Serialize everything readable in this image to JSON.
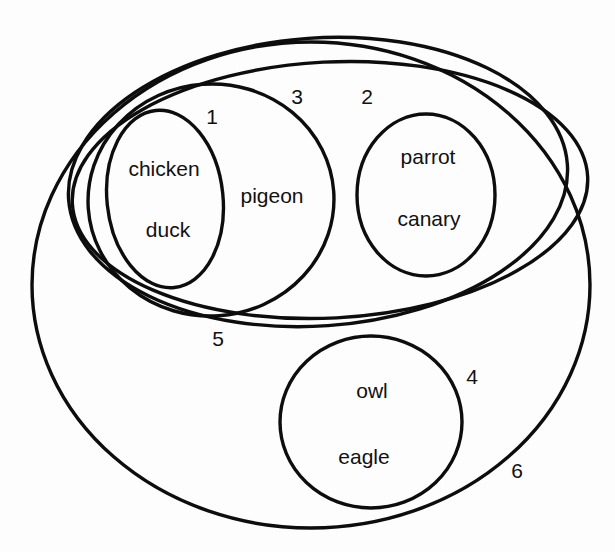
{
  "diagram": {
    "type": "nested-set-venn",
    "title": "",
    "background_color": "#fdfdfd",
    "stroke_color": "#0d0d0d",
    "text_color": "#111111",
    "regions": [
      {
        "id": "region-1",
        "label": "1",
        "label_x": 212,
        "label_y": 118,
        "shape": "ellipse",
        "cx": 165,
        "cy": 199,
        "rx": 58,
        "ry": 89,
        "rotation": -6,
        "members": [
          "chicken",
          "duck"
        ],
        "contains": []
      },
      {
        "id": "region-3",
        "label": "3",
        "label_x": 297,
        "label_y": 98,
        "shape": "ellipse",
        "cx": 211,
        "cy": 200,
        "rx": 123,
        "ry": 116,
        "rotation": -4,
        "members": [
          "pigeon"
        ],
        "contains": [
          "region-1"
        ]
      },
      {
        "id": "region-2",
        "label": "2",
        "label_x": 367,
        "label_y": 98,
        "shape": "ellipse",
        "cx": 330,
        "cy": 190,
        "rx": 258,
        "ry": 128,
        "rotation": -3,
        "members": [],
        "contains": [
          "region-3",
          "region-parrot"
        ]
      },
      {
        "id": "region-parrot",
        "label": "",
        "shape": "ellipse",
        "cx": 426,
        "cy": 195,
        "rx": 69,
        "ry": 81,
        "rotation": 0,
        "members": [
          "parrot",
          "canary"
        ],
        "contains": []
      },
      {
        "id": "region-5",
        "label": "5",
        "label_x": 218,
        "label_y": 340,
        "shape": "ellipse",
        "cx": 318,
        "cy": 182,
        "rx": 250,
        "ry": 144,
        "rotation": -4,
        "members": [],
        "contains": [
          "region-3"
        ]
      },
      {
        "id": "region-4",
        "label": "4",
        "label_x": 472,
        "label_y": 378,
        "shape": "ellipse",
        "cx": 371,
        "cy": 422,
        "rx": 91,
        "ry": 86,
        "rotation": 0,
        "members": [
          "owl",
          "eagle"
        ],
        "contains": []
      },
      {
        "id": "region-6",
        "label": "6",
        "label_x": 517,
        "label_y": 472,
        "shape": "ellipse",
        "cx": 311,
        "cy": 285,
        "rx": 279,
        "ry": 243,
        "rotation": 0,
        "members": [],
        "contains": [
          "region-2",
          "region-5",
          "region-4"
        ]
      }
    ],
    "members": [
      {
        "name": "chicken",
        "x": 164,
        "y": 170,
        "region": "region-1"
      },
      {
        "name": "duck",
        "x": 168,
        "y": 231,
        "region": "region-1"
      },
      {
        "name": "pigeon",
        "x": 272,
        "y": 197,
        "region": "region-3"
      },
      {
        "name": "parrot",
        "x": 428,
        "y": 158,
        "region": "region-parrot"
      },
      {
        "name": "canary",
        "x": 429,
        "y": 220,
        "region": "region-parrot"
      },
      {
        "name": "owl",
        "x": 372,
        "y": 392,
        "region": "region-4"
      },
      {
        "name": "eagle",
        "x": 364,
        "y": 458,
        "region": "region-4"
      }
    ],
    "set_labels": [
      {
        "text": "1",
        "x": 212,
        "y": 118
      },
      {
        "text": "3",
        "x": 297,
        "y": 98
      },
      {
        "text": "2",
        "x": 367,
        "y": 98
      },
      {
        "text": "5",
        "x": 218,
        "y": 340
      },
      {
        "text": "4",
        "x": 472,
        "y": 378
      },
      {
        "text": "6",
        "x": 517,
        "y": 472
      }
    ]
  }
}
